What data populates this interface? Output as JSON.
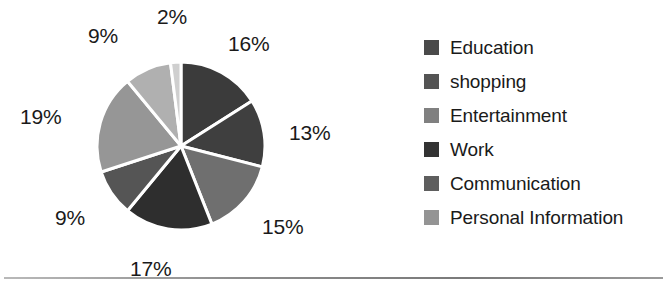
{
  "chart_data": {
    "type": "pie",
    "title": "",
    "labels": [
      "16%",
      "13%",
      "15%",
      "17%",
      "9%",
      "19%",
      "9%",
      "2%"
    ],
    "values": [
      16,
      13,
      15,
      17,
      9,
      19,
      9,
      2
    ],
    "total": 100,
    "units": "percent",
    "start_angle_deg": 0,
    "direction": "clockwise",
    "separator_color": "#ffffff",
    "slice_colors": [
      "#3b3b3b",
      "#3f3f3f",
      "#6f6f6f",
      "#2e2e2e",
      "#555555",
      "#969696",
      "#b0b0b0",
      "#cfcfcf"
    ],
    "slice_label_positions": [
      {
        "label": "16%",
        "x": 228,
        "y": 33
      },
      {
        "label": "13%",
        "x": 289,
        "y": 122
      },
      {
        "label": "15%",
        "x": 262,
        "y": 216
      },
      {
        "label": "17%",
        "x": 130,
        "y": 258
      },
      {
        "label": "9%",
        "x": 55,
        "y": 207
      },
      {
        "label": "19%",
        "x": 20,
        "y": 106
      },
      {
        "label": "9%",
        "x": 88,
        "y": 25
      },
      {
        "label": "2%",
        "x": 157,
        "y": 6
      }
    ],
    "legend": {
      "position": "right",
      "entries": [
        {
          "label": "Education",
          "color": "#4a4a4a"
        },
        {
          "label": "shopping",
          "color": "#545454"
        },
        {
          "label": "Entertainment",
          "color": "#808080"
        },
        {
          "label": "Work",
          "color": "#333333"
        },
        {
          "label": "Communication",
          "color": "#5e5e5e"
        },
        {
          "label": "Personal Information",
          "color": "#949494"
        }
      ]
    },
    "grid": false,
    "xlabel": "",
    "ylabel": ""
  }
}
